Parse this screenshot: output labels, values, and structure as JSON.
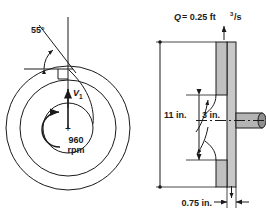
{
  "figure": {
    "name": "centrifugal-pump-impeller-figure",
    "background": "#ffffff",
    "line_color": "#1a1a1a",
    "shade_color": "#c8c8c8",
    "shade_color_dark": "#a9a9a9"
  },
  "front_view": {
    "name": "front-view",
    "blade_angle_label": "55°",
    "velocity_label": "V",
    "velocity_subscript": "1",
    "speed_value": "960",
    "speed_unit": "rpm",
    "center_mark": "+"
  },
  "side_view": {
    "name": "side-section-view",
    "flow_label_q": "Q",
    "flow_label_eq": "= 0.25 ft",
    "flow_label_exp": "3",
    "flow_label_tail": "/s",
    "flow_label_full": "Q = 0.25 ft3/s",
    "dim_outer": "11 in.",
    "dim_inner": "3 in.",
    "dim_width": "0.75 in."
  }
}
